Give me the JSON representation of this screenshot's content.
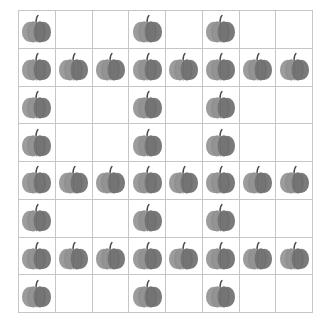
{
  "grid": {
    "rows": 8,
    "cols": 8,
    "line_color": "#c6c6c6",
    "item_icon": "pumpkin-icon",
    "filled": [
      [
        1,
        0,
        0,
        1,
        0,
        1,
        0,
        0
      ],
      [
        1,
        1,
        1,
        1,
        1,
        1,
        1,
        1
      ],
      [
        1,
        0,
        0,
        1,
        0,
        1,
        0,
        0
      ],
      [
        1,
        0,
        0,
        1,
        0,
        1,
        0,
        0
      ],
      [
        1,
        1,
        1,
        1,
        1,
        1,
        1,
        1
      ],
      [
        1,
        0,
        0,
        1,
        0,
        1,
        0,
        0
      ],
      [
        1,
        1,
        1,
        1,
        1,
        1,
        1,
        1
      ],
      [
        1,
        0,
        0,
        1,
        0,
        1,
        0,
        0
      ]
    ],
    "total_pumpkins": 36
  },
  "colors": {
    "pumpkin_light": "#9a9a9a",
    "pumpkin_mid": "#8a8a8a",
    "pumpkin_dark": "#747474",
    "stem": "#4a4a4a"
  }
}
